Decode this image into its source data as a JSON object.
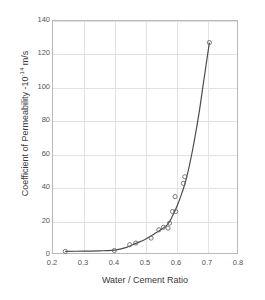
{
  "chart_data": {
    "type": "line",
    "title": "",
    "xlabel": "Water / Cement Ratio",
    "ylabel_text": "Coefficient of Permeability -10",
    "ylabel_exponent": "-14",
    "ylabel_units": " m/s",
    "ylabel_full": "Coefficient of Permeability -10^-14 m/s",
    "xlim": [
      0.2,
      0.8
    ],
    "ylim": [
      0,
      140
    ],
    "xticks": [
      "0.2",
      "0.3",
      "0.4",
      "0.5",
      "0.6",
      "0.7",
      "0.8"
    ],
    "xtick_values": [
      0.2,
      0.3,
      0.4,
      0.5,
      0.6,
      0.7,
      0.8
    ],
    "yticks": [
      "0",
      "20",
      "40",
      "60",
      "80",
      "100",
      "120",
      "140"
    ],
    "ytick_values": [
      0,
      20,
      40,
      60,
      80,
      100,
      120,
      140
    ],
    "grid": true,
    "legend": false,
    "marker": "open-circle",
    "line_color": "#4a4a4a",
    "marker_color": "#6a6a6a",
    "grid_color": "#e2e2e2",
    "frame_color": "#b9b9b9",
    "series": [
      {
        "name": "Permeability vs water/cement ratio",
        "x": [
          0.24,
          0.4,
          0.45,
          0.47,
          0.52,
          0.545,
          0.56,
          0.575,
          0.58,
          0.59,
          0.6,
          0.598,
          0.625,
          0.63,
          0.71
        ],
        "y": [
          1.0,
          1.5,
          5.0,
          6.0,
          9.0,
          14.0,
          15.5,
          15.0,
          18.0,
          25.0,
          25.0,
          34.0,
          42.0,
          46.0,
          127.0
        ]
      }
    ],
    "curve_x": [
      0.24,
      0.3,
      0.35,
      0.4,
      0.44,
      0.47,
      0.5,
      0.53,
      0.555,
      0.575,
      0.59,
      0.605,
      0.62,
      0.635,
      0.655,
      0.675,
      0.69,
      0.71
    ],
    "curve_y": [
      1.0,
      1.1,
      1.3,
      1.7,
      3.4,
      5.8,
      8.2,
      11.5,
      14.5,
      17.5,
      22.5,
      28.5,
      36.0,
      45.0,
      62.0,
      83.0,
      102.0,
      127.0
    ]
  }
}
